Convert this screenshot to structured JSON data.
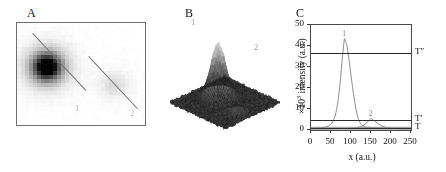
{
  "figure": {
    "panels": [
      {
        "letter": "A",
        "kind": "grayscale-image"
      },
      {
        "letter": "B",
        "kind": "surface-plot"
      },
      {
        "letter": "C",
        "kind": "line-chart"
      }
    ]
  },
  "panel_a": {
    "letter": "A",
    "spot_labels": [
      "1",
      "2"
    ],
    "description": "grayscale fluorescence image with two diagonal marker lines"
  },
  "panel_b": {
    "letter": "B",
    "peak_labels": [
      "1",
      "2"
    ],
    "description": "3D surface rendering of the intensity landscape"
  },
  "panel_c": {
    "letter": "C",
    "threshold_labels": [
      "T″",
      "T′",
      "T"
    ],
    "curve_labels": [
      "1",
      "2"
    ]
  },
  "chart_data": {
    "type": "line",
    "title": "",
    "xlabel": "x  (a.u.)",
    "ylabel": "×10³ intensity (a.u.)",
    "ylabel_prefix": "×10",
    "ylabel_exponent": "3",
    "ylabel_rest": " intensity (a.u.)",
    "xlim": [
      0,
      250
    ],
    "ylim": [
      0,
      50
    ],
    "xticks": [
      0,
      50,
      100,
      150,
      200,
      250
    ],
    "yticks": [
      0,
      10,
      20,
      30,
      40,
      50
    ],
    "grid": false,
    "legend": false,
    "thresholds": [
      {
        "label": "T″",
        "value": 36.5
      },
      {
        "label": "T′",
        "value": 4.6
      },
      {
        "label": "T",
        "value": 1.0
      }
    ],
    "series": [
      {
        "name": "1",
        "peak_x": 84,
        "peak_y": 43.5,
        "annotation": "1",
        "x": [
          0,
          8,
          16,
          24,
          32,
          40,
          46,
          52,
          58,
          62,
          66,
          70,
          74,
          78,
          82,
          84,
          86,
          88,
          90,
          94,
          98,
          102,
          106,
          110,
          114,
          118,
          124,
          130,
          138,
          146,
          156,
          168,
          182,
          200,
          220,
          250
        ],
        "y": [
          0.8,
          0.8,
          0.9,
          1.0,
          1.2,
          1.6,
          2.2,
          3.2,
          5.4,
          8.0,
          12.0,
          17.5,
          25.0,
          33.5,
          41.0,
          43.5,
          42.0,
          41.5,
          40.0,
          35.0,
          29.0,
          23.0,
          17.5,
          12.5,
          8.5,
          5.6,
          3.0,
          1.9,
          1.3,
          1.1,
          1.0,
          0.9,
          0.9,
          0.8,
          0.8,
          0.8
        ]
      },
      {
        "name": "2",
        "peak_x": 150,
        "peak_y": 5.4,
        "annotation": "2",
        "x": [
          0,
          40,
          80,
          100,
          112,
          120,
          126,
          132,
          138,
          144,
          148,
          150,
          152,
          156,
          162,
          168,
          174,
          180,
          186,
          192,
          200,
          210,
          225,
          250
        ],
        "y": [
          0.6,
          0.6,
          0.7,
          0.8,
          1.0,
          1.3,
          1.7,
          2.3,
          3.2,
          4.4,
          5.1,
          5.4,
          5.3,
          4.7,
          3.8,
          3.0,
          2.3,
          1.7,
          1.3,
          1.0,
          0.8,
          0.7,
          0.6,
          0.6
        ]
      }
    ],
    "baseline_band": {
      "y": 0.9,
      "color": "#9a9a9a"
    }
  },
  "colors": {
    "curve": "#7f7f7f",
    "axis": "#3a3a3a",
    "threshold": "#2b2b2b",
    "panel_border": "#6f6f6f",
    "label": "#111111",
    "number_annotation": "#9a9a9a"
  }
}
